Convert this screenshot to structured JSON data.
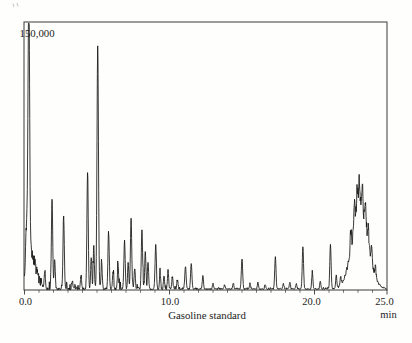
{
  "figure": {
    "y_fullscale_label": "150,000",
    "x_tick_labels": [
      "0.0",
      "10.0",
      "20.0",
      "25.0"
    ],
    "x_unit": "min",
    "caption": "Gasoline standard",
    "trace_color": "#141414",
    "frame_color": "#3a3a3a",
    "text_color": "#1d1d1d",
    "background_color": "#fefefc"
  },
  "chart_data": {
    "type": "line",
    "subtype": "gas-chromatogram",
    "title": "Gasoline standard",
    "xlabel": "min",
    "ylabel": "",
    "x_range": [
      0,
      25
    ],
    "y_range": [
      0,
      150000
    ],
    "y_fullscale": 150000,
    "x_ticks": [
      0,
      10,
      20,
      25
    ],
    "x_minor_tick_step": 1,
    "grid": false,
    "legend": "none",
    "peak_columns": [
      "time_min",
      "intensity_counts",
      "sigma_min"
    ],
    "peaks": [
      [
        0.15,
        33000,
        0.08
      ],
      [
        0.3,
        153000,
        0.055
      ],
      [
        0.5,
        16500,
        0.2
      ],
      [
        0.85,
        6000,
        0.25
      ],
      [
        1.4,
        9800,
        0.04
      ],
      [
        1.9,
        51000,
        0.045
      ],
      [
        2.08,
        17000,
        0.04
      ],
      [
        2.7,
        40500,
        0.045
      ],
      [
        3.3,
        4500,
        0.04
      ],
      [
        3.9,
        7500,
        0.04
      ],
      [
        4.35,
        66000,
        0.045
      ],
      [
        4.6,
        18000,
        0.04
      ],
      [
        4.78,
        24000,
        0.04
      ],
      [
        5.05,
        138000,
        0.05
      ],
      [
        5.32,
        15000,
        0.04
      ],
      [
        5.8,
        31500,
        0.045
      ],
      [
        6.1,
        9000,
        0.04
      ],
      [
        6.45,
        14000,
        0.04
      ],
      [
        6.9,
        27000,
        0.045
      ],
      [
        7.15,
        15000,
        0.04
      ],
      [
        7.35,
        40000,
        0.045
      ],
      [
        7.6,
        12000,
        0.04
      ],
      [
        8.1,
        33000,
        0.045
      ],
      [
        8.33,
        21000,
        0.04
      ],
      [
        8.52,
        15500,
        0.04
      ],
      [
        9.05,
        24500,
        0.045
      ],
      [
        9.35,
        9000,
        0.04
      ],
      [
        9.62,
        7500,
        0.04
      ],
      [
        9.9,
        10500,
        0.04
      ],
      [
        10.2,
        6800,
        0.04
      ],
      [
        10.55,
        5300,
        0.04
      ],
      [
        11.1,
        12800,
        0.045
      ],
      [
        11.5,
        14200,
        0.045
      ],
      [
        12.3,
        7500,
        0.04
      ],
      [
        13.0,
        3000,
        0.04
      ],
      [
        13.8,
        2300,
        0.04
      ],
      [
        14.4,
        3000,
        0.04
      ],
      [
        15.0,
        17200,
        0.045
      ],
      [
        15.55,
        3000,
        0.04
      ],
      [
        16.1,
        3800,
        0.04
      ],
      [
        16.6,
        2300,
        0.04
      ],
      [
        17.3,
        18000,
        0.045
      ],
      [
        17.85,
        3000,
        0.04
      ],
      [
        18.3,
        3800,
        0.04
      ],
      [
        18.75,
        3000,
        0.04
      ],
      [
        19.2,
        24000,
        0.045
      ],
      [
        19.85,
        9800,
        0.04
      ],
      [
        20.4,
        4200,
        0.04
      ],
      [
        21.1,
        25000,
        0.045
      ],
      [
        21.5,
        7500,
        0.04
      ],
      [
        21.8,
        5300,
        0.04
      ],
      [
        22.5,
        10500,
        0.04
      ],
      [
        22.75,
        13500,
        0.045
      ],
      [
        22.95,
        15000,
        0.05
      ],
      [
        23.1,
        18000,
        0.04
      ],
      [
        23.15,
        45000,
        0.55
      ],
      [
        23.3,
        13500,
        0.05
      ],
      [
        23.5,
        12000,
        0.045
      ],
      [
        23.7,
        9000,
        0.04
      ],
      [
        23.95,
        7500,
        0.04
      ],
      [
        24.2,
        6000,
        0.04
      ]
    ],
    "annotations": [
      {
        "text": "150,000",
        "position": "top-left-inside",
        "meaning": "full-scale intensity"
      },
      {
        "text": "Gasoline standard",
        "position": "below-x-axis",
        "meaning": "sample caption"
      }
    ]
  }
}
